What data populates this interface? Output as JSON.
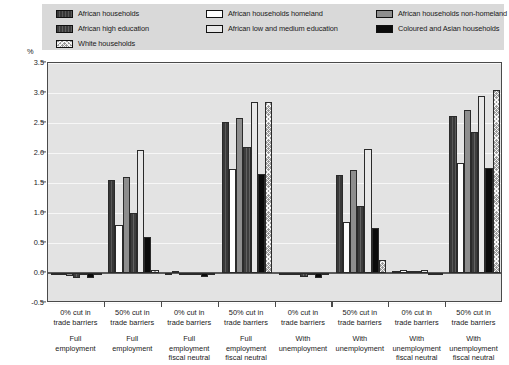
{
  "legend": {
    "items": [
      {
        "label": "African households",
        "key": "afr_hh",
        "pattern": "p-afrhh",
        "color": "#383838"
      },
      {
        "label": "African high education",
        "key": "afr_high_edu",
        "pattern": "p-afrhe",
        "color": "#3d3d3d"
      },
      {
        "label": "White households",
        "key": "white_hh",
        "pattern": "p-white",
        "color": "#9a9a9a"
      },
      {
        "label": "African households homeland",
        "key": "afr_homeland",
        "pattern": "p-homeland",
        "color": "#fdfdfd"
      },
      {
        "label": "African low and medium education",
        "key": "afr_low_med_edu",
        "pattern": "p-lowmed",
        "color": "#e8e8e8"
      },
      {
        "label": "African households non-homeland",
        "key": "afr_nonhomeland",
        "pattern": "p-nonhome",
        "color": "#8e8e8e"
      },
      {
        "label": "Coloured and Asian households",
        "key": "coloured_asian",
        "pattern": "p-coloured",
        "color": "#0b0b0b"
      }
    ]
  },
  "axis": {
    "unit_label": "%",
    "y_ticks": [
      "3.5",
      "3.0",
      "2.5",
      "2.0",
      "1.5",
      "1.0",
      "0.5",
      "0.0",
      "-0.5"
    ]
  },
  "chart_data": {
    "type": "bar",
    "title": "",
    "xlabel": "",
    "ylabel": "%",
    "ylim": [
      -0.5,
      3.5
    ],
    "ytick_values": [
      -0.5,
      0.0,
      0.5,
      1.0,
      1.5,
      2.0,
      2.5,
      3.0,
      3.5
    ],
    "grid": true,
    "legend_position": "top",
    "categories": [
      "0% cut in trade barriers / Full employment",
      "50% cut in trade barriers / Full employment",
      "0% cut in trade barriers / Full employment fiscal neutral",
      "50% cut in trade barriers / Full employment fiscal neutral",
      "0% cut in trade barriers / With unemployment",
      "50% cut in trade barriers / With unemployment",
      "0% cut in trade barriers / With unemployment fiscal neutral",
      "50% cut in trade barriers / With unemployment fiscal neutral"
    ],
    "category_lines": [
      {
        "line1": "0% cut in",
        "line2": "trade barriers",
        "line3": "Full",
        "line4": "employment",
        "line5": ""
      },
      {
        "line1": "50% cut in",
        "line2": "trade barriers",
        "line3": "Full",
        "line4": "employment",
        "line5": ""
      },
      {
        "line1": "0% cut in",
        "line2": "trade barriers",
        "line3": "Full",
        "line4": "employment",
        "line5": "fiscal neutral"
      },
      {
        "line1": "50% cut in",
        "line2": "trade barriers",
        "line3": "Full",
        "line4": "employment",
        "line5": "fiscal neutral"
      },
      {
        "line1": "0% cut in",
        "line2": "trade barriers",
        "line3": "With",
        "line4": "unemployment",
        "line5": ""
      },
      {
        "line1": "50% cut in",
        "line2": "trade barriers",
        "line3": "With",
        "line4": "unemployment",
        "line5": ""
      },
      {
        "line1": "0% cut in",
        "line2": "trade barriers",
        "line3": "With",
        "line4": "unemployment",
        "line5": "fiscal neutral"
      },
      {
        "line1": "50% cut in",
        "line2": "trade barriers",
        "line3": "With",
        "line4": "unemployment",
        "line5": "fiscal neutral"
      }
    ],
    "series": [
      {
        "name": "African households",
        "pattern": "p-afrhh",
        "values": [
          -0.04,
          1.55,
          -0.02,
          2.52,
          -0.03,
          1.63,
          0.04,
          2.62
        ]
      },
      {
        "name": "African households homeland",
        "pattern": "p-homeland",
        "values": [
          -0.02,
          0.8,
          0.04,
          1.73,
          -0.02,
          0.85,
          0.05,
          1.83
        ]
      },
      {
        "name": "African households non-homeland",
        "pattern": "p-nonhome",
        "values": [
          -0.05,
          1.6,
          -0.02,
          2.58,
          -0.03,
          1.72,
          0.04,
          2.72
        ]
      },
      {
        "name": "African high education",
        "pattern": "p-afrhe",
        "values": [
          -0.09,
          1.0,
          -0.04,
          2.1,
          -0.06,
          1.12,
          0.03,
          2.35
        ]
      },
      {
        "name": "African low and medium education",
        "pattern": "p-lowmed",
        "values": [
          -0.03,
          2.05,
          -0.02,
          2.85,
          -0.02,
          2.07,
          0.05,
          2.95
        ]
      },
      {
        "name": "Coloured and Asian households",
        "pattern": "p-coloured",
        "values": [
          -0.08,
          0.6,
          -0.07,
          1.65,
          -0.09,
          0.75,
          -0.03,
          1.75
        ]
      },
      {
        "name": "White households",
        "pattern": "p-white",
        "values": [
          -0.03,
          0.05,
          -0.03,
          2.85,
          -0.03,
          0.22,
          -0.02,
          3.05
        ]
      }
    ]
  }
}
